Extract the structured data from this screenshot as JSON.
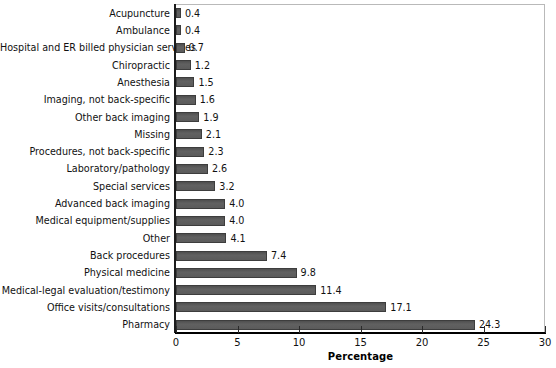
{
  "chart_data": {
    "type": "bar",
    "orientation": "horizontal",
    "title": "",
    "subtitle": "",
    "xlabel": "Percentage",
    "ylabel": "",
    "xlim": [
      0,
      30
    ],
    "xticks": [
      0,
      5,
      10,
      15,
      20,
      25,
      30
    ],
    "xtick_labels": [
      "0",
      "5",
      "10",
      "15",
      "20",
      "25",
      "30"
    ],
    "grid": false,
    "legend": null,
    "bar_color": "#5a5a5a",
    "bar_edge_color": "#3d3d3d",
    "categories": [
      "Acupuncture",
      "Ambulance",
      "Hospital and ER billed physician services",
      "Chiropractic",
      "Anesthesia",
      "Imaging, not back-specific",
      "Other back imaging",
      "Missing",
      "Procedures, not back-specific",
      "Laboratory/pathology",
      "Special services",
      "Advanced back imaging",
      "Medical equipment/supplies",
      "Other",
      "Back procedures",
      "Physical medicine",
      "Medical-legal evaluation/testimony",
      "Office visits/consultations",
      "Pharmacy"
    ],
    "values": [
      0.4,
      0.4,
      0.7,
      1.2,
      1.5,
      1.6,
      1.9,
      2.1,
      2.3,
      2.6,
      3.2,
      4.0,
      4.0,
      4.1,
      7.4,
      9.8,
      11.4,
      17.1,
      24.3
    ],
    "value_labels": [
      "0.4",
      "0.4",
      "0.7",
      "1.2",
      "1.5",
      "1.6",
      "1.9",
      "2.1",
      "2.3",
      "2.6",
      "3.2",
      "4.0",
      "4.0",
      "4.1",
      "7.4",
      "9.8",
      "11.4",
      "17.1",
      "24.3"
    ]
  }
}
